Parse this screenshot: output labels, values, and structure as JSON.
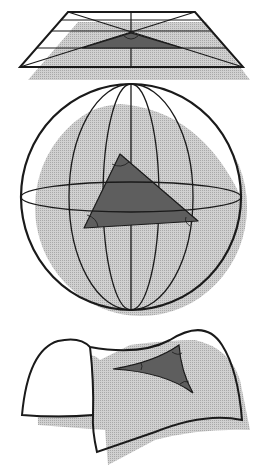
{
  "figure": {
    "panels": [
      {
        "id": "flat",
        "surface": "plane",
        "curvature": "zero",
        "triangle": "euclidean"
      },
      {
        "id": "sphere",
        "surface": "sphere",
        "curvature": "positive",
        "triangle": "spherical"
      },
      {
        "id": "saddle",
        "surface": "saddle",
        "curvature": "negative",
        "triangle": "hyperbolic"
      }
    ]
  },
  "colors": {
    "background": "#ffffff",
    "outline": "#1a1a1a",
    "shadow": "#c4c4c4",
    "triangle_fill": "#5e5e5e",
    "surface_fill": "#ffffff"
  }
}
